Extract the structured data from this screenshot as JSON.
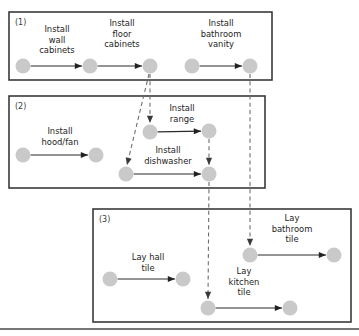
{
  "figure": {
    "type": "precedence-network-diagram",
    "background_color": "#ffffff",
    "node_color": "#c9c9c9",
    "box_border_color": "#3a3a3a",
    "solid_edge_color": "#2b2b2b",
    "dashed_edge_color": "#6e6e6e"
  },
  "groups": [
    {
      "id": "g1",
      "tag": "(1)",
      "x": 9,
      "y": 12,
      "w": 263,
      "h": 68
    },
    {
      "id": "g2",
      "tag": "(2)",
      "x": 9,
      "y": 96,
      "w": 256,
      "h": 92
    },
    {
      "id": "g3",
      "tag": "(3)",
      "x": 93,
      "y": 209,
      "w": 258,
      "h": 113
    }
  ],
  "nodes": [
    {
      "id": "n1",
      "group": "g1",
      "cx": 23,
      "cy": 66,
      "r": 7.5
    },
    {
      "id": "n2",
      "group": "g1",
      "cx": 90,
      "cy": 66,
      "r": 7.5
    },
    {
      "id": "n3",
      "group": "g1",
      "cx": 150,
      "cy": 66,
      "r": 7.5
    },
    {
      "id": "n4",
      "group": "g1",
      "cx": 192,
      "cy": 66,
      "r": 7.5
    },
    {
      "id": "n5",
      "group": "g1",
      "cx": 250,
      "cy": 66,
      "r": 7.5
    },
    {
      "id": "n6",
      "group": "g2",
      "cx": 23,
      "cy": 155,
      "r": 7.5
    },
    {
      "id": "n7",
      "group": "g2",
      "cx": 96,
      "cy": 155,
      "r": 7.5
    },
    {
      "id": "n8",
      "group": "g2",
      "cx": 150,
      "cy": 132,
      "r": 7.5
    },
    {
      "id": "n9",
      "group": "g2",
      "cx": 209,
      "cy": 131,
      "r": 7.5
    },
    {
      "id": "n10",
      "group": "g2",
      "cx": 126,
      "cy": 174,
      "r": 7.5
    },
    {
      "id": "n11",
      "group": "g2",
      "cx": 209,
      "cy": 174,
      "r": 7.5
    },
    {
      "id": "n12",
      "group": "g3",
      "cx": 110,
      "cy": 279,
      "r": 7.5
    },
    {
      "id": "n13",
      "group": "g3",
      "cx": 183,
      "cy": 279,
      "r": 7.5
    },
    {
      "id": "n14",
      "group": "g3",
      "cx": 250,
      "cy": 255,
      "r": 7.5
    },
    {
      "id": "n15",
      "group": "g3",
      "cx": 334,
      "cy": 255,
      "r": 7.5
    },
    {
      "id": "n16",
      "group": "g3",
      "cx": 208,
      "cy": 308,
      "r": 7.5
    },
    {
      "id": "n17",
      "group": "g3",
      "cx": 290,
      "cy": 308,
      "r": 7.5
    }
  ],
  "activities": [
    {
      "id": "a1",
      "label_lines": [
        "Install",
        "wall",
        "cabinets"
      ],
      "from": "n1",
      "to": "n2",
      "label_x": 57,
      "label_y": 32
    },
    {
      "id": "a2",
      "label_lines": [
        "Install",
        "floor",
        "cabinets"
      ],
      "from": "n2",
      "to": "n3",
      "label_x": 122,
      "label_y": 26
    },
    {
      "id": "a3",
      "label_lines": [
        "Install",
        "bathroom",
        "vanity"
      ],
      "from": "n4",
      "to": "n5",
      "label_x": 221,
      "label_y": 26
    },
    {
      "id": "a4",
      "label_lines": [
        "Install",
        "hood/fan"
      ],
      "from": "n6",
      "to": "n7",
      "label_x": 60,
      "label_y": 134
    },
    {
      "id": "a5",
      "label_lines": [
        "Install",
        "range"
      ],
      "from": "n8",
      "to": "n9",
      "label_x": 182,
      "label_y": 111
    },
    {
      "id": "a6",
      "label_lines": [
        "Install",
        "dishwasher"
      ],
      "from": "n10",
      "to": "n11",
      "label_x": 168,
      "label_y": 153
    },
    {
      "id": "a7",
      "label_lines": [
        "Lay hall",
        "tile"
      ],
      "from": "n12",
      "to": "n13",
      "label_x": 148,
      "label_y": 260
    },
    {
      "id": "a8",
      "label_lines": [
        "Lay",
        "bathroom",
        "tile"
      ],
      "from": "n14",
      "to": "n15",
      "label_x": 292,
      "label_y": 221
    },
    {
      "id": "a9",
      "label_lines": [
        "Lay",
        "kitchen",
        "tile"
      ],
      "from": "n16",
      "to": "n17",
      "label_x": 244,
      "label_y": 274
    }
  ],
  "dependencies": [
    {
      "id": "d1",
      "from": "n3",
      "to": "n8",
      "style": "dashed",
      "path": "M150,74 L150,123"
    },
    {
      "id": "d2",
      "from": "n3",
      "to": "n10",
      "style": "dashed",
      "path": "M149,74 L127,165"
    },
    {
      "id": "d3",
      "from": "n9",
      "to": "n11",
      "style": "dashed",
      "path": "M209,139 L209,165"
    },
    {
      "id": "d4",
      "from": "n11",
      "to": "n16",
      "style": "dashed",
      "path": "M209,182 L208,299"
    },
    {
      "id": "d5",
      "from": "n5",
      "to": "n14",
      "style": "dashed",
      "path": "M250,74 L250,246"
    }
  ],
  "footer_rule": {
    "y": 329,
    "x1": 0,
    "x2": 359
  }
}
